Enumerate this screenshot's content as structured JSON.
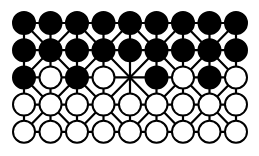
{
  "game": {
    "name": "Fanorona",
    "rows": 5,
    "cols": 9,
    "board": [
      [
        "B",
        "B",
        "B",
        "B",
        "B",
        "B",
        "B",
        "B",
        "B"
      ],
      [
        "B",
        "B",
        "B",
        "B",
        "B",
        "B",
        "B",
        "B",
        "B"
      ],
      [
        "B",
        "W",
        "B",
        "W",
        "",
        "B",
        "W",
        "B",
        "W"
      ],
      [
        "W",
        "W",
        "W",
        "W",
        "W",
        "W",
        "W",
        "W",
        "W"
      ],
      [
        "W",
        "W",
        "W",
        "W",
        "W",
        "W",
        "W",
        "W",
        "W"
      ]
    ],
    "legend": {
      "B": "black-piece",
      "W": "white-piece",
      "": "empty-point"
    }
  },
  "layout": {
    "origin_x": 24,
    "origin_y": 23,
    "spacing_x": 26.5,
    "spacing_y": 27.2,
    "piece_radius": 11
  },
  "colors": {
    "black": "#000000",
    "white": "#ffffff",
    "line": "#000000",
    "background": "#ffffff"
  }
}
